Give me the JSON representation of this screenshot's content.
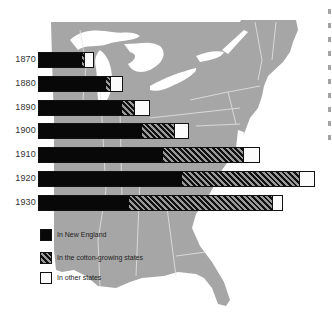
{
  "colors": {
    "new_england": "#080808",
    "cotton_states_hatch_dark": "#111111",
    "cotton_states_hatch_light": "#9a9a9a",
    "other_states": "#fbfbfb",
    "map_land": "#a6a6a6",
    "map_borders": "#e6e6e6",
    "background": "#ffffff"
  },
  "legend": [
    {
      "key": "new_england",
      "label": "In New England"
    },
    {
      "key": "cotton",
      "label": "In the cotton-growing states"
    },
    {
      "key": "other",
      "label": "In other states"
    }
  ],
  "chart_data": {
    "type": "bar",
    "orientation": "horizontal",
    "stacked": true,
    "title": "",
    "xlabel": "",
    "ylabel": "",
    "grid": false,
    "legend_position": "bottom-left",
    "units": "relative bar length (no numeric axis shown; values estimated in pixel units)",
    "categories": [
      "1870",
      "1880",
      "1890",
      "1900",
      "1910",
      "1920",
      "1930"
    ],
    "series": [
      {
        "name": "In New England",
        "values": [
          43,
          67,
          83,
          103,
          124,
          143,
          90
        ]
      },
      {
        "name": "In the cotton-growing states",
        "values": [
          2,
          4,
          12,
          32,
          80,
          117,
          143
        ]
      },
      {
        "name": "In other states",
        "values": [
          9,
          12,
          15,
          14,
          16,
          15,
          10
        ]
      }
    ],
    "background": "map of the eastern United States"
  }
}
